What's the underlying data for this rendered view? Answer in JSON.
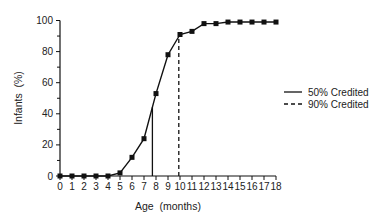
{
  "chart_data": {
    "type": "line",
    "title": "",
    "xlabel": "Age  (months)",
    "ylabel": "Infants  (%)",
    "xlim": [
      0,
      18
    ],
    "ylim": [
      0,
      100
    ],
    "x_ticks": [
      0,
      1,
      2,
      3,
      4,
      5,
      6,
      7,
      8,
      9,
      10,
      11,
      12,
      13,
      14,
      15,
      16,
      17,
      18
    ],
    "y_ticks": [
      0,
      20,
      40,
      60,
      80,
      100
    ],
    "y_minor_ticks": [
      10,
      30,
      50,
      70,
      90
    ],
    "grid": false,
    "series": [
      {
        "name": "Cumulative % infants",
        "marker": "square",
        "x": [
          0,
          1,
          2,
          3,
          4,
          5,
          6,
          7,
          8,
          9,
          10,
          11,
          12,
          13,
          14,
          15,
          16,
          17,
          18
        ],
        "values": [
          0,
          0,
          0,
          0,
          0,
          2,
          12,
          24,
          53,
          78,
          91,
          93,
          98,
          98,
          99,
          99,
          99,
          99,
          99
        ]
      }
    ],
    "reference_lines": [
      {
        "label": "50% Credited",
        "x": 7.7,
        "style": "solid"
      },
      {
        "label": "90% Credited",
        "x": 9.9,
        "style": "dashed"
      }
    ],
    "legend": {
      "position": "right",
      "entries": [
        {
          "label": "50% Credited",
          "style": "solid"
        },
        {
          "label": "90% Credited",
          "style": "dashed"
        }
      ]
    }
  }
}
